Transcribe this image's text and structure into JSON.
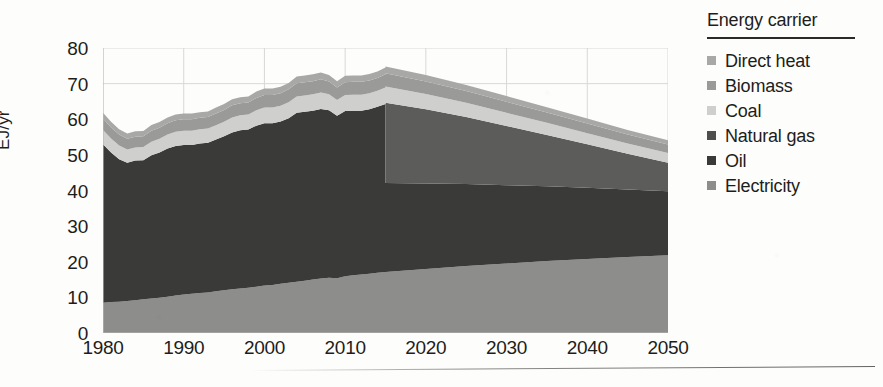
{
  "chart_data": {
    "type": "area",
    "stacked": true,
    "title": "",
    "xlabel": "",
    "ylabel": "EJ/yr",
    "xlim": [
      1980,
      2050
    ],
    "ylim": [
      0,
      80
    ],
    "ytick_step": 10,
    "xtick_step": 10,
    "grid": "light vertical gridlines at decades and horizontal line at top (80)",
    "legend_position": "right",
    "legend_title": "Energy carrier",
    "projection_split_year": 2015,
    "yticks": [
      "0",
      "10",
      "20",
      "30",
      "40",
      "50",
      "60",
      "70",
      "80"
    ],
    "xticks": [
      "1980",
      "1990",
      "2000",
      "2010",
      "2020",
      "2030",
      "2040",
      "2050"
    ],
    "x": [
      1980,
      1981,
      1982,
      1983,
      1984,
      1985,
      1986,
      1987,
      1988,
      1989,
      1990,
      1991,
      1992,
      1993,
      1994,
      1995,
      1996,
      1997,
      1998,
      1999,
      2000,
      2001,
      2002,
      2003,
      2004,
      2005,
      2006,
      2007,
      2008,
      2009,
      2010,
      2011,
      2012,
      2013,
      2014,
      2015,
      2015,
      2020,
      2025,
      2030,
      2035,
      2040,
      2045,
      2050
    ],
    "series": [
      {
        "name": "Electricity",
        "color": "#8d8d8b",
        "order": 1,
        "values": [
          8.5,
          8.7,
          8.8,
          9.0,
          9.2,
          9.5,
          9.7,
          9.9,
          10.2,
          10.5,
          10.8,
          11.0,
          11.2,
          11.4,
          11.7,
          12.0,
          12.3,
          12.5,
          12.7,
          13.0,
          13.3,
          13.5,
          13.8,
          14.1,
          14.4,
          14.7,
          15.0,
          15.3,
          15.5,
          15.4,
          15.9,
          16.2,
          16.4,
          16.6,
          16.9,
          17.1,
          17.1,
          18.0,
          18.8,
          19.5,
          20.2,
          20.8,
          21.3,
          21.8
        ]
      },
      {
        "name": "Oil",
        "color": "#3a3a38",
        "order": 2,
        "values": [
          44.5,
          42.0,
          40.0,
          38.8,
          39.2,
          39.0,
          40.2,
          40.8,
          41.6,
          42.0,
          42.0,
          41.8,
          42.0,
          42.0,
          42.6,
          43.2,
          44.0,
          44.4,
          44.4,
          45.2,
          45.6,
          45.4,
          45.6,
          46.2,
          47.4,
          47.4,
          47.4,
          47.6,
          47.0,
          45.6,
          46.4,
          46.2,
          46.0,
          46.2,
          46.6,
          47.2,
          25.0,
          24.0,
          23.0,
          22.0,
          21.0,
          20.0,
          19.0,
          18.0
        ]
      },
      {
        "name": "Natural gas",
        "color": "#5c5c5a",
        "order": 3,
        "values": [
          0,
          0,
          0,
          0,
          0,
          0,
          0,
          0,
          0,
          0,
          0,
          0,
          0,
          0,
          0,
          0,
          0,
          0,
          0,
          0,
          0,
          0,
          0,
          0,
          0,
          0,
          0,
          0,
          0,
          0,
          0,
          0,
          0,
          0,
          0,
          0,
          22.5,
          20.8,
          18.8,
          16.6,
          14.4,
          12.2,
          10.0,
          8.0
        ]
      },
      {
        "name": "Coal",
        "color": "#cfcfcd",
        "order": 4,
        "values": [
          4.0,
          3.9,
          3.8,
          3.7,
          3.7,
          3.7,
          3.8,
          3.8,
          3.9,
          4.0,
          4.0,
          4.0,
          4.0,
          4.0,
          4.0,
          4.1,
          4.2,
          4.2,
          4.2,
          4.3,
          4.4,
          4.4,
          4.4,
          4.5,
          4.6,
          4.6,
          4.6,
          4.6,
          4.5,
          4.4,
          4.5,
          4.5,
          4.5,
          4.5,
          4.5,
          4.6,
          4.6,
          4.3,
          4.0,
          3.7,
          3.4,
          3.1,
          2.9,
          2.7
        ]
      },
      {
        "name": "Biomass",
        "color": "#9a9a98",
        "order": 5,
        "values": [
          3.2,
          3.1,
          3.1,
          3.0,
          3.0,
          3.0,
          3.1,
          3.1,
          3.2,
          3.2,
          3.2,
          3.2,
          3.2,
          3.2,
          3.3,
          3.3,
          3.4,
          3.4,
          3.4,
          3.5,
          3.5,
          3.5,
          3.5,
          3.6,
          3.7,
          3.7,
          3.7,
          3.7,
          3.6,
          3.5,
          3.6,
          3.6,
          3.6,
          3.6,
          3.6,
          3.7,
          3.7,
          3.5,
          3.3,
          3.1,
          2.9,
          2.7,
          2.5,
          2.4
        ]
      },
      {
        "name": "Direct heat",
        "color": "#a8a8a6",
        "order": 6,
        "values": [
          1.6,
          1.6,
          1.5,
          1.5,
          1.5,
          1.5,
          1.6,
          1.6,
          1.6,
          1.6,
          1.6,
          1.6,
          1.6,
          1.6,
          1.7,
          1.7,
          1.7,
          1.7,
          1.7,
          1.8,
          1.8,
          1.8,
          1.8,
          1.8,
          1.9,
          1.9,
          1.9,
          1.9,
          1.8,
          1.8,
          1.8,
          1.8,
          1.8,
          1.8,
          1.8,
          1.9,
          1.9,
          1.8,
          1.7,
          1.6,
          1.5,
          1.4,
          1.3,
          1.2
        ]
      }
    ],
    "totals_note": "Totals rise from ~62 EJ/yr in 1980 to a peak of ~77 EJ/yr at 2015, then decline to ~44 EJ/yr by 2050"
  },
  "legend": {
    "title": "Energy carrier",
    "items": [
      {
        "label": "Direct heat",
        "color": "#a8a8a6"
      },
      {
        "label": "Biomass",
        "color": "#9a9a98"
      },
      {
        "label": "Coal",
        "color": "#cfcfcd"
      },
      {
        "label": "Natural gas",
        "color": "#4e4e4c"
      },
      {
        "label": "Oil",
        "color": "#3a3a38"
      },
      {
        "label": "Electricity",
        "color": "#8d8d8b"
      }
    ]
  },
  "axes": {
    "y_title": "EJ/yr",
    "y_labels": [
      "80",
      "70",
      "60",
      "50",
      "40",
      "30",
      "20",
      "10",
      "0"
    ],
    "x_labels": [
      "1980",
      "1990",
      "2000",
      "2010",
      "2020",
      "2030",
      "2040",
      "2050"
    ]
  },
  "colors": {
    "axis_text": "#1d1d1b",
    "gridline": "#d8d8d6",
    "background": "#fdfdfc"
  }
}
